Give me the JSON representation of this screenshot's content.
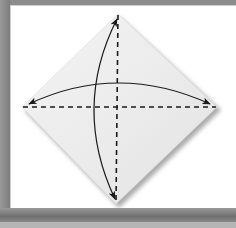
{
  "diagram": {
    "paper": {
      "shape": "square rotated 45 degrees (diamond)",
      "fill": "#ececec",
      "shadow": "#9a9a9a",
      "vertices": {
        "top": [
          118,
          14
        ],
        "left": [
          22,
          107
        ],
        "right": [
          217,
          107
        ],
        "bottom": [
          116,
          204
        ]
      }
    },
    "folds": [
      {
        "type": "valley-fold",
        "style": "dashed",
        "orientation": "vertical",
        "from": [
          118,
          14
        ],
        "to": [
          116,
          204
        ]
      },
      {
        "type": "valley-fold",
        "style": "dashed",
        "orientation": "horizontal",
        "from": [
          22,
          107
        ],
        "to": [
          217,
          107
        ]
      }
    ],
    "arrows": [
      {
        "type": "fold-and-unfold",
        "direction": "left-right",
        "heads": "both",
        "from": [
          28,
          104
        ],
        "to": [
          211,
          104
        ],
        "arc_peak": [
          118,
          83
        ]
      },
      {
        "type": "fold-and-unfold",
        "direction": "top-bottom",
        "heads": "both",
        "from": [
          117,
          19
        ],
        "to": [
          115,
          199
        ],
        "arc_peak": [
          95,
          107
        ]
      }
    ],
    "colors": {
      "frame": "#8a8a8a",
      "background": "#ffffff",
      "line": "#1a1a1a"
    }
  }
}
